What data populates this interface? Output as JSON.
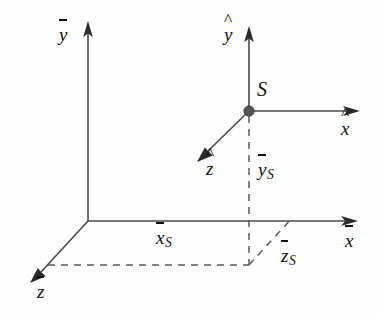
{
  "diagram": {
    "background_color": "#fefefe",
    "axis_color": "#4a4a4a",
    "dash_color": "#5a5a5a",
    "label_color": "#111111",
    "point_color": "#555555"
  },
  "labels": {
    "y_bar": {
      "base": "y",
      "accent": "overbar",
      "subscript": ""
    },
    "y_hat": {
      "base": "y",
      "accent": "hat",
      "subscript": ""
    },
    "x_bar": {
      "base": "x",
      "accent": "overbar",
      "subscript": ""
    },
    "x_hat": {
      "base": "x",
      "accent": "hat",
      "subscript": ""
    },
    "z_bar": {
      "base": "z",
      "accent": "overbar",
      "subscript": ""
    },
    "z_hat": {
      "base": "z",
      "accent": "hat",
      "subscript": ""
    },
    "point_s": {
      "base": "S",
      "accent": "none",
      "subscript": ""
    },
    "x_bar_s": {
      "base": "x",
      "accent": "overbar",
      "subscript": "S"
    },
    "y_bar_s": {
      "base": "y",
      "accent": "overbar",
      "subscript": "S"
    },
    "z_bar_s": {
      "base": "z",
      "accent": "overbar",
      "subscript": "S"
    }
  },
  "geometry": {
    "global_origin": {
      "x": 88,
      "y": 221
    },
    "point_s": {
      "x": 249,
      "y": 111
    },
    "y_bar_axis_tip": {
      "x": 88,
      "y": 22
    },
    "x_bar_axis_tip": {
      "x": 357,
      "y": 221
    },
    "z_bar_axis_tip": {
      "x": 31,
      "y": 282
    },
    "y_hat_axis_tip": {
      "x": 249,
      "y": 27
    },
    "x_hat_axis_tip": {
      "x": 359,
      "y": 111
    },
    "z_hat_axis_tip": {
      "x": 198,
      "y": 160
    },
    "projection_foot_xz": {
      "x": 249,
      "y": 221
    },
    "projection_corner_ground": {
      "x": 249,
      "y": 265
    },
    "dashed_ground_start": {
      "x": 48,
      "y": 265
    },
    "dashed_zs_tip": {
      "x": 293,
      "y": 217
    }
  }
}
